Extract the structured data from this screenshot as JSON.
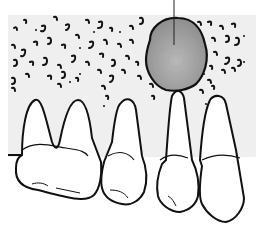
{
  "figure": {
    "type": "dental-illustration",
    "colors": {
      "background": "#ffffff",
      "bone": "#efefef",
      "lesion_fill": "#9a9a9a",
      "lesion_center": "#b5b5b5",
      "outline": "#111111",
      "tooth_fill": "#ffffff"
    },
    "elements": {
      "lesion": {
        "label": "lesion",
        "cx": 175,
        "cy": 52,
        "rx": 31,
        "ry": 34
      },
      "leader_line": {
        "x": 174,
        "y1": 0,
        "y2": 45
      },
      "teeth": [
        {
          "name": "molar",
          "roots": 2
        },
        {
          "name": "premolar",
          "roots": 1
        },
        {
          "name": "affected-tooth",
          "roots": 1
        },
        {
          "name": "adjacent-tooth",
          "roots": 1
        }
      ]
    }
  }
}
